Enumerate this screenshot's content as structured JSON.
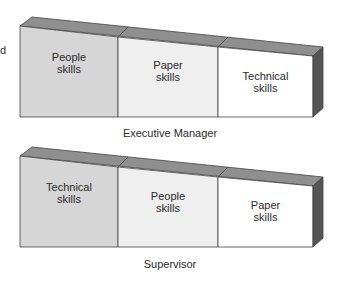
{
  "edge_fragment": "d",
  "diagrams": [
    {
      "caption": "Executive Manager",
      "segments": [
        {
          "line1": "People",
          "line2": "skills",
          "fill": "#d6d6d6"
        },
        {
          "line1": "Paper",
          "line2": "skills",
          "fill": "#efefef"
        },
        {
          "line1": "Technical",
          "line2": "skills",
          "fill": "#ffffff"
        }
      ]
    },
    {
      "caption": "Supervisor",
      "segments": [
        {
          "line1": "Technical",
          "line2": "skills",
          "fill": "#d6d6d6"
        },
        {
          "line1": "People",
          "line2": "skills",
          "fill": "#efefef"
        },
        {
          "line1": "Paper",
          "line2": "skills",
          "fill": "#ffffff"
        }
      ]
    }
  ],
  "colors": {
    "top_face": "#8f8f8f",
    "side_face": "#555555",
    "outline": "#444444"
  }
}
